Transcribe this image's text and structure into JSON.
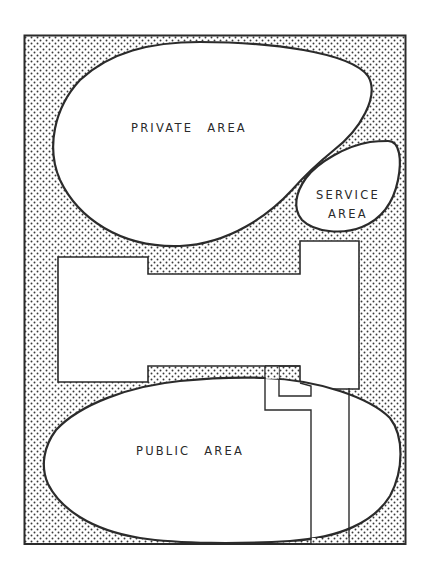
{
  "diagram": {
    "type": "site-plan zoning diagram",
    "zones": {
      "private": {
        "label_word1": "PRIVATE",
        "label_word2": "AREA"
      },
      "service": {
        "label_line1": "SERVICE",
        "label_line2": "AREA"
      },
      "public": {
        "label_word1": "PUBLIC",
        "label_word2": "AREA"
      }
    },
    "elements": [
      "site-boundary",
      "stippled-landscape-buffer",
      "private-area-bubble",
      "service-area-bubble",
      "public-area-bubble",
      "building-footprint",
      "entry-walkway",
      "driveway"
    ],
    "colors": {
      "line": "#2b2b2b",
      "fill": "#ffffff",
      "stipple": "#3a3a3a",
      "background": "#ffffff"
    }
  }
}
